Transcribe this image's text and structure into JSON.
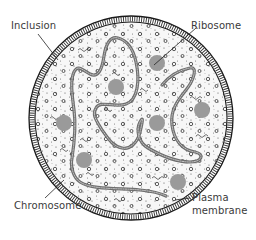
{
  "labels": {
    "inclusion": "Inclusion",
    "ribosome": "Ribosome",
    "chromosome": "Chromosome",
    "plasma_membrane_line1": "Plasma",
    "plasma_membrane_line2": "membrane"
  },
  "colors": {
    "background": "#ffffff",
    "cytoplasm": "#f7f7f7",
    "membrane": "#1a1a1a",
    "ribosome_fill": "#9a9a9a",
    "chromosome": "#6e6e6e",
    "label_text": "#3a3a3a"
  },
  "cell": {
    "cx": 131,
    "cy": 118,
    "r": 100
  },
  "ribosomes": [
    {
      "cx": 157,
      "cy": 63,
      "r": 8
    },
    {
      "cx": 116,
      "cy": 87,
      "r": 8
    },
    {
      "cx": 202,
      "cy": 110,
      "r": 8
    },
    {
      "cx": 64,
      "cy": 123,
      "r": 8
    },
    {
      "cx": 157,
      "cy": 123,
      "r": 8
    },
    {
      "cx": 84,
      "cy": 160,
      "r": 8
    },
    {
      "cx": 178,
      "cy": 182,
      "r": 8
    }
  ]
}
